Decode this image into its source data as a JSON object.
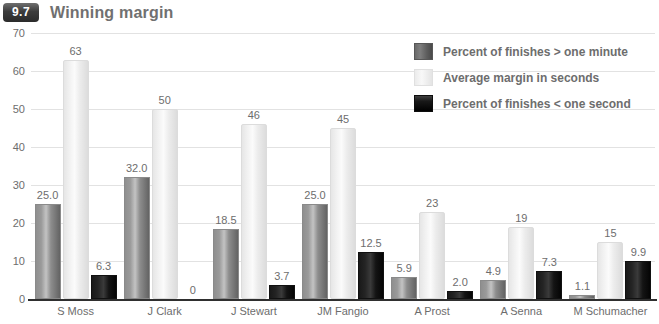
{
  "header": {
    "badge": "9.7",
    "title": "Winning margin"
  },
  "chart_data": {
    "type": "bar",
    "title": "Winning margin",
    "xlabel": "",
    "ylabel": "",
    "ylim": [
      0,
      70
    ],
    "yticks": [
      0,
      10,
      20,
      30,
      40,
      50,
      60,
      70
    ],
    "grid": true,
    "legend_position": "top-right",
    "categories": [
      "S Moss",
      "J Clark",
      "J Stewart",
      "JM Fangio",
      "A Prost",
      "A Senna",
      "M Schumacher"
    ],
    "series": [
      {
        "name": "Percent of finishes > one minute",
        "color": "#8d8d8d",
        "values": [
          25.0,
          32.0,
          18.5,
          25.0,
          5.9,
          4.9,
          1.1
        ],
        "labels": [
          "25.0",
          "32.0",
          "18.5",
          "25.0",
          "5.9",
          "4.9",
          "1.1"
        ]
      },
      {
        "name": "Average margin in seconds",
        "color": "#f2f2f2",
        "values": [
          63,
          50,
          46,
          45,
          23,
          19,
          15
        ],
        "labels": [
          "63",
          "50",
          "46",
          "45",
          "23",
          "19",
          "15"
        ]
      },
      {
        "name": "Percent of finishes < one second",
        "color": "#0a0a0a",
        "values": [
          6.3,
          0,
          3.7,
          12.5,
          2.0,
          7.3,
          9.9
        ],
        "labels": [
          "6.3",
          "0",
          "3.7",
          "12.5",
          "2.0",
          "7.3",
          "9.9"
        ]
      }
    ]
  }
}
